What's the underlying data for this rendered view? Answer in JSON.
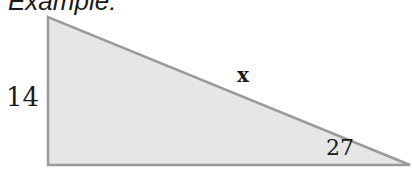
{
  "title": "Example:",
  "triangle": {
    "fill": "#e6e6e6",
    "stroke": "#9a9a9a",
    "vertices": {
      "top": [
        48,
        17
      ],
      "bottom_left": [
        48,
        165
      ],
      "bottom_right": [
        410,
        165
      ]
    },
    "labels": {
      "left_side": "14",
      "hypotenuse": "x",
      "angle": "27"
    }
  }
}
